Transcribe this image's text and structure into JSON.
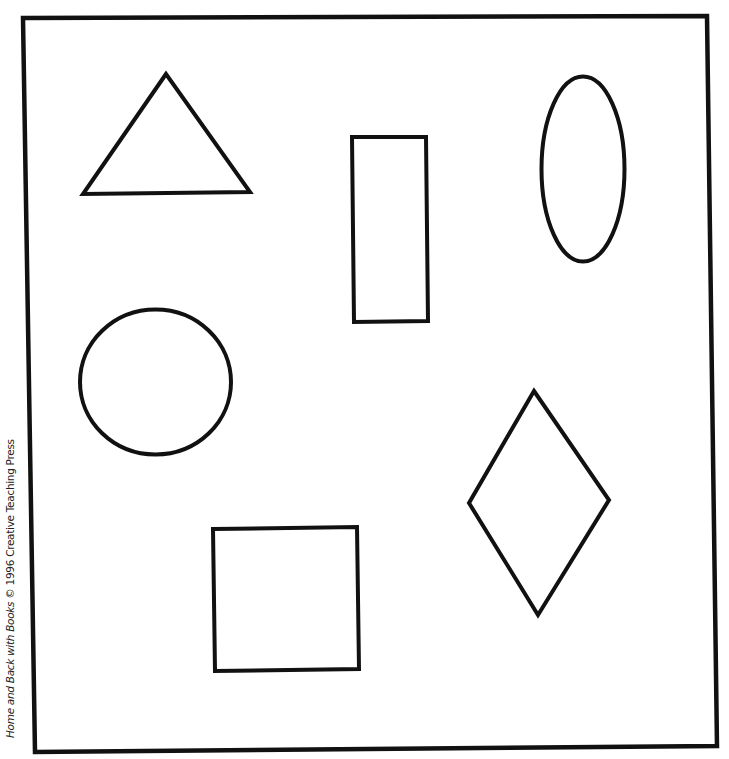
{
  "worksheet": {
    "credit": {
      "title": "Home and Back with Books",
      "rest": " © 1996 Creative Teaching Press"
    },
    "colors": {
      "background": "#ffffff",
      "stroke": "#111111"
    },
    "shapes": [
      {
        "name": "triangle",
        "type": "polygon"
      },
      {
        "name": "rectangle",
        "type": "polygon"
      },
      {
        "name": "oval",
        "type": "ellipse"
      },
      {
        "name": "circle",
        "type": "ellipse"
      },
      {
        "name": "diamond",
        "type": "polygon"
      },
      {
        "name": "square",
        "type": "polygon"
      }
    ]
  }
}
